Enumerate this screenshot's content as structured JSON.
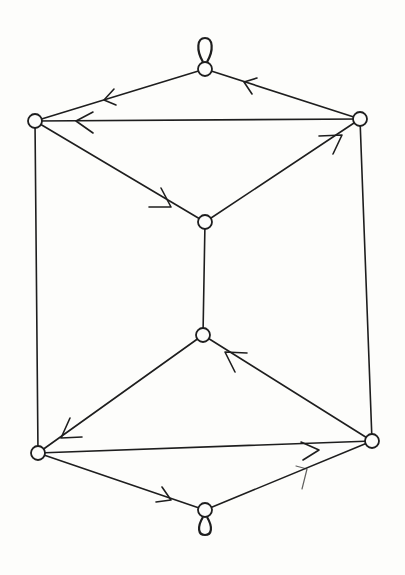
{
  "diagram": {
    "type": "directed-graph",
    "background": "#fdfdfb",
    "stroke_color": "#1e1e1e",
    "nodes": [
      {
        "id": "top",
        "x": 205,
        "y": 69,
        "loop": "up"
      },
      {
        "id": "upper-left",
        "x": 35,
        "y": 121
      },
      {
        "id": "upper-right",
        "x": 360,
        "y": 119
      },
      {
        "id": "middle-upper",
        "x": 205,
        "y": 222
      },
      {
        "id": "middle-lower",
        "x": 203,
        "y": 335
      },
      {
        "id": "lower-left",
        "x": 38,
        "y": 453
      },
      {
        "id": "lower-right",
        "x": 372,
        "y": 441
      },
      {
        "id": "bottom",
        "x": 205,
        "y": 510,
        "loop": "down"
      }
    ],
    "edges": [
      {
        "from": "top",
        "to": "upper-left",
        "directed": true
      },
      {
        "from": "upper-right",
        "to": "top",
        "directed": true
      },
      {
        "from": "upper-right",
        "to": "upper-left",
        "directed": true
      },
      {
        "from": "upper-left",
        "to": "middle-upper",
        "directed": true
      },
      {
        "from": "middle-upper",
        "to": "upper-right",
        "directed": true
      },
      {
        "from": "middle-upper",
        "to": "middle-lower",
        "directed": false
      },
      {
        "from": "upper-left",
        "to": "lower-left",
        "directed": false
      },
      {
        "from": "upper-right",
        "to": "lower-right",
        "directed": false
      },
      {
        "from": "middle-lower",
        "to": "lower-left",
        "directed": true
      },
      {
        "from": "lower-right",
        "to": "middle-lower",
        "directed": true
      },
      {
        "from": "lower-left",
        "to": "lower-right",
        "directed": true
      },
      {
        "from": "lower-left",
        "to": "bottom",
        "directed": true
      },
      {
        "from": "bottom",
        "to": "lower-right",
        "directed": true,
        "faint": true
      }
    ],
    "node_count": 8,
    "edge_count": 13,
    "loops": 2
  }
}
